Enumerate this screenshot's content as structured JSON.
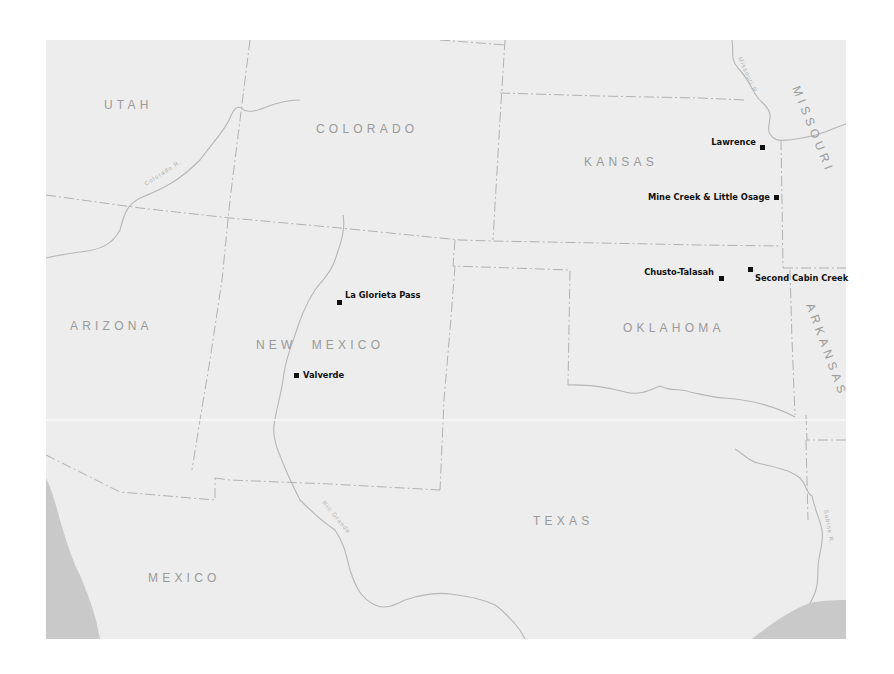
{
  "map": {
    "background_color": "#ededed",
    "water_color": "#c9c9c9",
    "border_color": "#a9a9a9",
    "label_color": "#9a9a9a",
    "marker_color": "#111111",
    "states": [
      {
        "name": "UTAH",
        "x": 104,
        "y": 109
      },
      {
        "name": "COLORADO",
        "x": 316,
        "y": 133
      },
      {
        "name": "KANSAS",
        "x": 584,
        "y": 166
      },
      {
        "name": "ARIZONA",
        "x": 70,
        "y": 330
      },
      {
        "name": "NEW  MEXICO",
        "x": 256,
        "y": 349
      },
      {
        "name": "OKLAHOMA",
        "x": 623,
        "y": 332
      },
      {
        "name": "TEXAS",
        "x": 533,
        "y": 525
      },
      {
        "name": "MEXICO",
        "x": 148,
        "y": 582
      }
    ],
    "rotated_states": [
      {
        "name": "MISSOURI",
        "x": 791,
        "y": 89,
        "rotate": 70
      },
      {
        "name": "ARKANSAS",
        "x": 807,
        "y": 301,
        "rotate": 70
      }
    ],
    "rivers": [
      {
        "name": "Colorado R.",
        "x": 146,
        "y": 184,
        "rotate": -33
      },
      {
        "name": "Missouri R.",
        "x": 739,
        "y": 58,
        "rotate": 68
      },
      {
        "name": "Rio Grande",
        "x": 323,
        "y": 505,
        "rotate": 45
      },
      {
        "name": "Sabine R.",
        "x": 822,
        "y": 508,
        "rotate": 80
      }
    ],
    "sites": [
      {
        "name": "Lawrence",
        "label_x": 757,
        "label_y": 145,
        "anchor": "end",
        "mx": 760,
        "my": 144
      },
      {
        "name": "Mine Creek & Little Osage",
        "label_x": 771,
        "label_y": 200,
        "anchor": "end",
        "mx": 774,
        "my": 194
      },
      {
        "name": "Chusto-Talasah",
        "label_x": 715,
        "label_y": 274,
        "anchor": "end",
        "mx": 718,
        "my": 276
      },
      {
        "name": "Second Cabin Creek",
        "label_x": 756,
        "label_y": 281,
        "anchor": "start",
        "mx": 747,
        "my": 267
      },
      {
        "name": "La Glorieta Pass",
        "label_x": 345,
        "label_y": 299,
        "anchor": "start",
        "mx": 337,
        "my": 300
      },
      {
        "name": "Valverde",
        "label_x": 303,
        "label_y": 378,
        "anchor": "start",
        "mx": 294,
        "my": 373
      }
    ]
  }
}
